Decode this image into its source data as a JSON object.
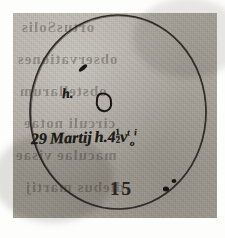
{
  "document": {
    "type": "manuscript-scan",
    "title": "Sunspot observation drawing",
    "medium": "ink on aged paper"
  },
  "drawing": {
    "solar_disk": {
      "name": "solar-disk-circle",
      "cx": 118,
      "cy": 112,
      "r": 89,
      "stroke_color": "#23201b",
      "stroke_width": 1.6
    },
    "sunspots": [
      {
        "label": "",
        "name": "sunspot-upper",
        "cx": 83,
        "cy": 68,
        "rx": 4.5,
        "ry": 2.2,
        "rotation": -38,
        "style": "filled"
      },
      {
        "label": "h",
        "name": "sunspot-main",
        "cx": 104,
        "cy": 101,
        "rx": 6.5,
        "ry": 8.0,
        "rotation": 12,
        "style": "outlined"
      },
      {
        "label": "",
        "name": "sunspot-lower-right",
        "cx": 167,
        "cy": 188,
        "rx": 3.0,
        "ry": 2.4,
        "rotation": 0,
        "style": "filled"
      },
      {
        "label": "",
        "name": "sunspot-lower-right-small",
        "cx": 174,
        "cy": 182,
        "rx": 2.2,
        "ry": 1.8,
        "rotation": 0,
        "style": "filled"
      }
    ]
  },
  "annotations": {
    "spot_label": "h.",
    "date_line": {
      "day": "29",
      "month": "Martij",
      "hour_prefix": "h.",
      "hour": "4",
      "fraction_numerator": "1",
      "fraction_denominator": "2",
      "suffix": "v",
      "superscript": "t",
      "subscript": "o",
      "trailing": "i",
      "full_text": "29 Martij h.4 ½ v"
    },
    "folio_number": "15"
  },
  "paper": {
    "base_color": "#b2aea6",
    "ink_color": "#23201b",
    "margin_color": "#fdfdfc",
    "showthrough_lines": [
      {
        "text": "ortusSolis",
        "left": 8,
        "top": 6,
        "size": 15
      },
      {
        "text": "observationes",
        "left": 4,
        "top": 38,
        "size": 15
      },
      {
        "text": "obstellarum",
        "left": 6,
        "top": 70,
        "size": 15
      },
      {
        "text": "circuli notae",
        "left": 10,
        "top": 102,
        "size": 15
      },
      {
        "text": "maculae visae",
        "left": 2,
        "top": 134,
        "size": 15
      },
      {
        "text": "diebus martij",
        "left": 12,
        "top": 166,
        "size": 15
      }
    ]
  }
}
